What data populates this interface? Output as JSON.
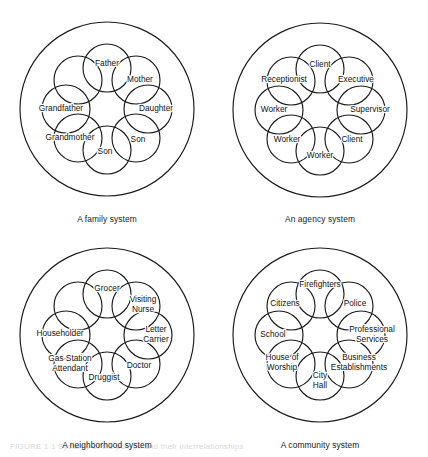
{
  "figure": {
    "background": "#ffffff",
    "stroke_color": "#1b1b1b",
    "text_color": "#131313",
    "caption": "FIGURE 1.1   Systems of the person and their interrelationships"
  },
  "geometry": {
    "outer_radius": 87,
    "node_radius": 24,
    "ring_radius": 41,
    "start_angle_deg": -90
  },
  "panels": [
    {
      "id": "family-system",
      "caption": "A family system",
      "cx": 107,
      "cy": 109,
      "caption_x": 107,
      "caption_y": 214,
      "nodes": [
        {
          "label": "Father",
          "lines": [
            "Father"
          ],
          "dx": 0,
          "dy": -4
        },
        {
          "label": "Mother",
          "lines": [
            "Mother"
          ],
          "dx": 4,
          "dy": 0
        },
        {
          "label": "Daughter",
          "lines": [
            "Daughter"
          ],
          "dx": 8,
          "dy": 0
        },
        {
          "label": "Son",
          "lines": [
            "Son"
          ],
          "dx": 2,
          "dy": 2
        },
        {
          "label": "Son",
          "lines": [
            "Son"
          ],
          "dx": -2,
          "dy": 2
        },
        {
          "label": "Grandmother",
          "lines": [
            "Grandmother"
          ],
          "dx": -8,
          "dy": 0
        },
        {
          "label": "Grandfather",
          "lines": [
            "Grandfather"
          ],
          "dx": -5,
          "dy": 0
        },
        {
          "label": "",
          "lines": [],
          "dx": 0,
          "dy": 0
        }
      ]
    },
    {
      "id": "agency-system",
      "caption": "An agency system",
      "cx": 320,
      "cy": 110,
      "caption_x": 320,
      "caption_y": 214,
      "nodes": [
        {
          "label": "Client",
          "lines": [
            "Client"
          ],
          "dx": 0,
          "dy": -4
        },
        {
          "label": "Executive",
          "lines": [
            "Executive"
          ],
          "dx": 7,
          "dy": -1
        },
        {
          "label": "Supervisor",
          "lines": [
            "Supervisor"
          ],
          "dx": 9,
          "dy": 0
        },
        {
          "label": "Client",
          "lines": [
            "Client"
          ],
          "dx": 3,
          "dy": 1
        },
        {
          "label": "Worker",
          "lines": [
            "Worker"
          ],
          "dx": 0,
          "dy": 5
        },
        {
          "label": "Worker",
          "lines": [
            "Worker"
          ],
          "dx": -4,
          "dy": 1
        },
        {
          "label": "Worker",
          "lines": [
            "Worker"
          ],
          "dx": -5,
          "dy": 0
        },
        {
          "label": "Receptionist",
          "lines": [
            "Receptionist"
          ],
          "dx": -7,
          "dy": -1
        }
      ]
    },
    {
      "id": "neighborhood-system",
      "caption": "A neighborhood system",
      "cx": 107,
      "cy": 335,
      "caption_x": 107,
      "caption_y": 440,
      "nodes": [
        {
          "label": "Grocer",
          "lines": [
            "Grocer"
          ],
          "dx": 0,
          "dy": -5
        },
        {
          "label": "Visiting Nurse",
          "lines": [
            "Visiting",
            "Nurse"
          ],
          "dx": 7,
          "dy": -1
        },
        {
          "label": "Letter Carrier",
          "lines": [
            "Letter",
            "Carrier"
          ],
          "dx": 8,
          "dy": 0
        },
        {
          "label": "Doctor",
          "lines": [
            "Doctor"
          ],
          "dx": 3,
          "dy": 2
        },
        {
          "label": "Druggist",
          "lines": [
            "Druggist"
          ],
          "dx": -3,
          "dy": 2
        },
        {
          "label": "Gas Station Attendant",
          "lines": [
            "Gas Station",
            "Attendant"
          ],
          "dx": -8,
          "dy": 0
        },
        {
          "label": "Householder",
          "lines": [
            "Householder"
          ],
          "dx": -6,
          "dy": -1
        },
        {
          "label": "",
          "lines": [],
          "dx": 0,
          "dy": 0
        }
      ]
    },
    {
      "id": "community-system",
      "caption": "A community system",
      "cx": 320,
      "cy": 335,
      "caption_x": 320,
      "caption_y": 440,
      "nodes": [
        {
          "label": "Firefighters",
          "lines": [
            "Firefighters"
          ],
          "dx": 0,
          "dy": -9
        },
        {
          "label": "Police",
          "lines": [
            "Police"
          ],
          "dx": 6,
          "dy": -2
        },
        {
          "label": "Professional Services",
          "lines": [
            "Professional",
            "Services"
          ],
          "dx": 11,
          "dy": 0
        },
        {
          "label": "Business Establishments",
          "lines": [
            "Business",
            "Establishments"
          ],
          "dx": 10,
          "dy": -1
        },
        {
          "label": "City Hall",
          "lines": [
            "City",
            "Hall"
          ],
          "dx": 0,
          "dy": 5
        },
        {
          "label": "House of Worship",
          "lines": [
            "House of",
            "Worship"
          ],
          "dx": -9,
          "dy": -1
        },
        {
          "label": "School",
          "lines": [
            "School"
          ],
          "dx": -6,
          "dy": 0
        },
        {
          "label": "Citizens",
          "lines": [
            "Citizens"
          ],
          "dx": -6,
          "dy": -2
        }
      ]
    }
  ]
}
